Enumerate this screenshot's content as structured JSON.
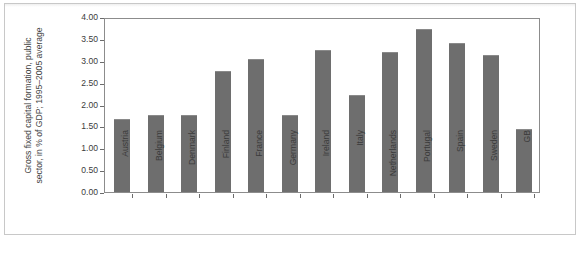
{
  "figure": {
    "y_axis_title": "Gross fixed capital formation, public\nsector, in % of GDP; 1995–2005 average",
    "caption": "Gross fixed capital formation, public sector, in % of GDP, 1995–2005 average",
    "caption_marker": "2"
  },
  "chart_data": {
    "type": "bar",
    "title": "",
    "xlabel": "",
    "ylabel": "Gross fixed capital formation, public sector, in % of GDP; 1995–2005 average",
    "ylim": [
      0.0,
      4.0
    ],
    "ytick_labels": [
      "0.00",
      "0.50",
      "1.00",
      "1.50",
      "2.00",
      "2.50",
      "3.00",
      "3.50",
      "4.00"
    ],
    "ytick_values": [
      0.0,
      0.5,
      1.0,
      1.5,
      2.0,
      2.5,
      3.0,
      3.5,
      4.0
    ],
    "grid": false,
    "legend": "none",
    "bar_color": "#6e6e6e",
    "categories": [
      "Austria",
      "Belgium",
      "Denmark",
      "Finland",
      "France",
      "Germany",
      "Ireland",
      "Italy",
      "Netherlands",
      "Portugal",
      "Spain",
      "Sweden",
      "GB"
    ],
    "values": [
      1.68,
      1.76,
      1.76,
      2.77,
      3.05,
      1.76,
      3.25,
      2.22,
      3.21,
      3.72,
      3.4,
      3.13,
      1.43
    ]
  }
}
